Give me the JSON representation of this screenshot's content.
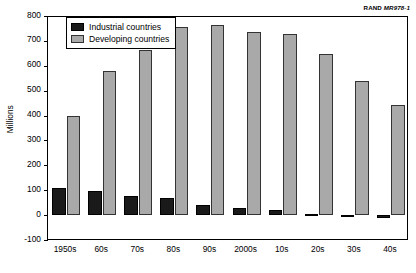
{
  "credit": {
    "org": "RAND",
    "document_number": "MR978-1"
  },
  "chart_data": {
    "type": "bar",
    "title": "",
    "xlabel": "",
    "ylabel": "Millions",
    "ylim": [
      -100,
      800
    ],
    "ytick_step": 100,
    "yticks": [
      800,
      700,
      600,
      500,
      400,
      300,
      200,
      100,
      0,
      -100
    ],
    "ytick_labels": [
      "800",
      "700",
      "600",
      "500",
      "400",
      "300",
      "200",
      "100",
      "0",
      "-100"
    ],
    "grid": false,
    "legend_position": "top-left",
    "categories": [
      "1950s",
      "60s",
      "70s",
      "80s",
      "90s",
      "2000s",
      "10s",
      "20s",
      "30s",
      "40s"
    ],
    "series": [
      {
        "name": "Industrial countries",
        "color": "#1a1a1a",
        "values": [
          110,
          95,
          78,
          70,
          42,
          30,
          22,
          4,
          -8,
          -12
        ]
      },
      {
        "name": "Developing countries",
        "color": "#a9a9a9",
        "values": [
          400,
          580,
          665,
          755,
          762,
          735,
          727,
          647,
          540,
          443
        ]
      }
    ]
  }
}
